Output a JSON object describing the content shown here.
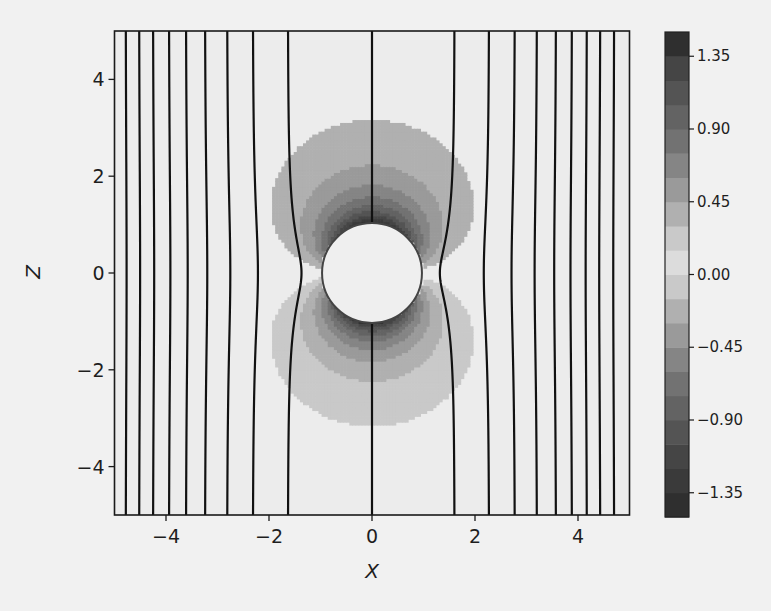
{
  "chart_data": {
    "type": "contour",
    "title": "",
    "xlabel": "X",
    "ylabel": "Z",
    "xlim": [
      -5,
      5
    ],
    "ylim": [
      -5,
      5
    ],
    "xticks": [
      -4,
      -2,
      0,
      2,
      4
    ],
    "yticks": [
      -4,
      -2,
      0,
      2,
      4
    ],
    "xtick_labels": [
      "−4",
      "−2",
      "0",
      "2",
      "4"
    ],
    "ytick_labels": [
      "−4",
      "−2",
      "0",
      "2",
      "4"
    ],
    "obstacle": {
      "shape": "circle",
      "center": [
        0,
        0
      ],
      "radius": 1
    },
    "line_contours": {
      "description": "equipotential lines, x-position at top/bottom edge (z=±5)",
      "color": "#111111",
      "x_at_edge": [
        -4.78,
        -4.52,
        -4.25,
        -3.94,
        -3.61,
        -3.24,
        -2.81,
        -2.31,
        -1.63,
        0.0,
        1.6,
        2.27,
        2.77,
        3.2,
        3.57,
        3.88,
        4.17,
        4.43,
        4.7
      ]
    },
    "filled_contours": {
      "levels": [
        -1.5,
        -1.35,
        -1.2,
        -1.05,
        -0.9,
        -0.75,
        -0.6,
        -0.45,
        -0.3,
        -0.15,
        0.0,
        0.15,
        0.3,
        0.45,
        0.6,
        0.75,
        0.9,
        1.05,
        1.2,
        1.35,
        1.5
      ],
      "colormap": "greys (diverging around 0, light at 0)"
    },
    "colorbar": {
      "ticks": [
        1.35,
        0.9,
        0.45,
        0.0,
        -0.45,
        -0.9,
        -1.35
      ],
      "tick_labels": [
        "1.35",
        "0.90",
        "0.45",
        "0.00",
        "−0.45",
        "−0.90",
        "−1.35"
      ],
      "range": [
        -1.5,
        1.5
      ],
      "colors": [
        "#2f2f2f",
        "#3a3a3a",
        "#454545",
        "#545454",
        "#636363",
        "#727272",
        "#858585",
        "#9a9a9a",
        "#b0b0b0",
        "#c9c9c9",
        "#dcdcdc",
        "#c9c9c9",
        "#b0b0b0",
        "#9a9a9a",
        "#858585",
        "#727272",
        "#636363",
        "#545454",
        "#454545",
        "#2f2f2f"
      ]
    },
    "legend": null,
    "grid": false
  }
}
